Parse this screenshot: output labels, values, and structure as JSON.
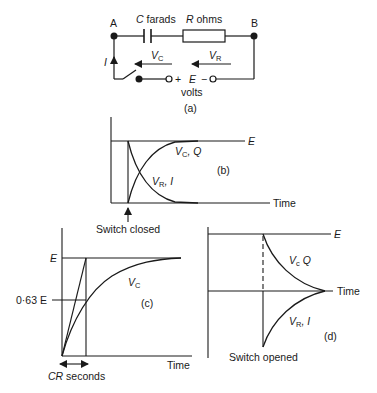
{
  "panel_a": {
    "caption": "(a)",
    "node_a": "A",
    "node_b": "B",
    "capacitor_symbol": "C",
    "capacitor_unit": "farads",
    "resistor_symbol": "R",
    "resistor_unit": "ohms",
    "vc_main": "V",
    "vc_sub": "C",
    "vr_main": "V",
    "vr_sub": "R",
    "current": "I",
    "plus": "+",
    "source": "E",
    "minus": "−",
    "source_unit": "volts"
  },
  "panel_b": {
    "caption": "(b)",
    "e_label": "E",
    "time_label": "Time",
    "vc_curve_main": "V",
    "vc_curve_sub": "C",
    "vc_curve_rest": ", Q",
    "vr_curve_main": "V",
    "vr_curve_sub": "R",
    "vr_curve_rest": ", I",
    "switch_label": "Switch closed"
  },
  "panel_c": {
    "caption": "(c)",
    "e_label": "E",
    "tau_level_label": "0·63 E",
    "vc_main": "V",
    "vc_sub": "C",
    "time_label": "Time",
    "tau_symbol": "CR",
    "tau_unit": "seconds"
  },
  "panel_d": {
    "caption": "(d)",
    "e_label": "E",
    "time_label": "Time",
    "vc_main": "V",
    "vc_sub": "c",
    "vc_rest": " Q",
    "vr_main": "V",
    "vr_sub": "R",
    "vr_rest": ", I",
    "switch_label": "Switch opened"
  }
}
